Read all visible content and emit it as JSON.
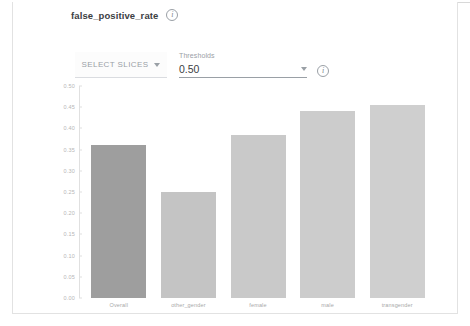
{
  "header": {
    "title": "false_positive_rate",
    "info_icon": "info-icon",
    "info_glyph": "i"
  },
  "controls": {
    "select_slices_label": "SELECT SLICES",
    "select_slices_caret": "chevron-down-icon",
    "thresholds_label": "Thresholds",
    "thresholds_value": "0.50",
    "thresholds_caret": "chevron-down-icon",
    "thresholds_info_icon": "info-icon"
  },
  "chart_data": {
    "type": "bar",
    "title": "false_positive_rate",
    "xlabel": "",
    "ylabel": "",
    "categories": [
      "Overall",
      "other_gender",
      "female",
      "male",
      "transgender"
    ],
    "values": [
      0.36,
      0.25,
      0.385,
      0.44,
      0.455
    ],
    "ylim": [
      0.0,
      0.5
    ],
    "yticks": [
      "0.00",
      "0.05",
      "0.10",
      "0.15",
      "0.20",
      "0.25",
      "0.30",
      "0.35",
      "0.40",
      "0.45",
      "0.50"
    ],
    "ytick_values": [
      0.0,
      0.05,
      0.1,
      0.15,
      0.2,
      0.25,
      0.3,
      0.35,
      0.4,
      0.45,
      0.5
    ],
    "grid": false,
    "legend": "none",
    "bar_colors": [
      "#9e9e9e",
      "#c4c4c4",
      "#c9c9c9",
      "#cccccc",
      "#cfcfcf"
    ]
  },
  "colors": {
    "panel_border": "#e2e2e2",
    "axis": "#e0e0e0",
    "tick_text": "#b6b6b6",
    "label_text": "#a8a8a8",
    "title_text": "#3c4043"
  }
}
